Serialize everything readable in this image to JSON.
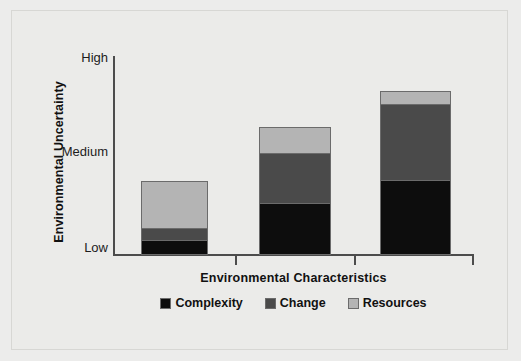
{
  "chart_data": {
    "type": "bar",
    "subtype": "stacked-bar",
    "title": "",
    "xlabel": "Environmental Characteristics",
    "ylabel": "Environmental Uncertainty",
    "categories": [
      "Simple + Stable",
      "Complex + Stable",
      "Complex + Unstable"
    ],
    "category_labels_shown": false,
    "y_tick_labels": [
      "High",
      "Medium",
      "Low"
    ],
    "y_tick_values": [
      1.0,
      0.5,
      0.0
    ],
    "ylim": [
      0,
      1
    ],
    "grid": false,
    "legend_position": "bottom-center",
    "series": [
      {
        "name": "Complexity",
        "color": "#0d0d0d",
        "values": [
          0.065,
          0.26,
          0.375
        ]
      },
      {
        "name": "Change",
        "color": "#4a4a4a",
        "values": [
          0.065,
          0.255,
          0.385
        ]
      },
      {
        "name": "Resources",
        "color": "#b4b4b4",
        "values": [
          0.235,
          0.125,
          0.06
        ]
      }
    ],
    "stack_totals": [
      0.365,
      0.64,
      0.82
    ]
  },
  "axes": {
    "y_ticks": [
      {
        "label": "High",
        "top_px": 51
      },
      {
        "label": "Medium",
        "top_px": 145
      },
      {
        "label": "Low",
        "top_px": 241
      }
    ],
    "x_ticks_px": [
      235,
      354,
      472
    ]
  },
  "bars": [
    {
      "name": "bar-1",
      "left_px": 141,
      "width_px": 67,
      "top_px": 181,
      "height_px": 74,
      "segments": [
        {
          "series": "Resources",
          "height_px": 47,
          "color": "#b4b4b4"
        },
        {
          "series": "Change",
          "height_px": 13,
          "color": "#4a4a4a"
        },
        {
          "series": "Complexity",
          "height_px": 14,
          "color": "#0d0d0d"
        }
      ]
    },
    {
      "name": "bar-2",
      "left_px": 259,
      "width_px": 72,
      "top_px": 127,
      "height_px": 128,
      "segments": [
        {
          "series": "Resources",
          "height_px": 25,
          "color": "#b4b4b4"
        },
        {
          "series": "Change",
          "height_px": 51,
          "color": "#4a4a4a"
        },
        {
          "series": "Complexity",
          "height_px": 52,
          "color": "#0d0d0d"
        }
      ]
    },
    {
      "name": "bar-3",
      "left_px": 380,
      "width_px": 71,
      "top_px": 91,
      "height_px": 164,
      "segments": [
        {
          "series": "Resources",
          "height_px": 12,
          "color": "#b4b4b4"
        },
        {
          "series": "Change",
          "height_px": 77,
          "color": "#4a4a4a"
        },
        {
          "series": "Complexity",
          "height_px": 75,
          "color": "#0d0d0d"
        }
      ]
    }
  ],
  "legend": {
    "items": [
      {
        "label": "Complexity",
        "color": "#0d0d0d"
      },
      {
        "label": "Change",
        "color": "#4a4a4a"
      },
      {
        "label": "Resources",
        "color": "#b4b4b4"
      }
    ]
  },
  "colors": {
    "background": "#ebebe9",
    "axis": "#4c4c4c",
    "text": "#111111",
    "complexity": "#0d0d0d",
    "change": "#4a4a4a",
    "resources": "#b4b4b4",
    "bar_border": "#6b6b6b"
  }
}
